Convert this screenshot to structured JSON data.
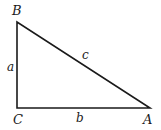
{
  "diagram": {
    "type": "right-triangle",
    "vertices": {
      "B": {
        "label": "B",
        "x": 17,
        "y": 22
      },
      "C": {
        "label": "C",
        "x": 17,
        "y": 108
      },
      "A": {
        "label": "A",
        "x": 150,
        "y": 108
      }
    },
    "sides": {
      "a": {
        "label": "a",
        "from": "C",
        "to": "B"
      },
      "b": {
        "label": "b",
        "from": "C",
        "to": "A"
      },
      "c": {
        "label": "c",
        "from": "B",
        "to": "A"
      }
    },
    "right_angle_at": "C",
    "stroke_color": "#1a1a1a"
  }
}
